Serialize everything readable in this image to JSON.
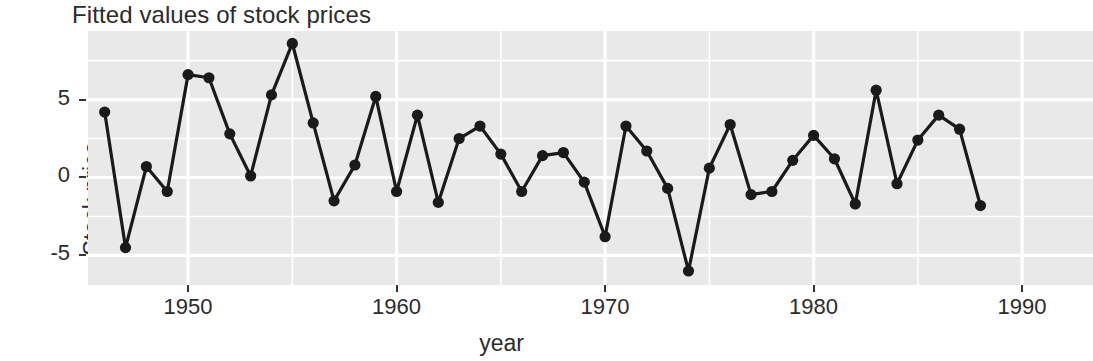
{
  "chart_data": {
    "type": "line",
    "title": "Fitted values of stock prices",
    "xlabel": "year",
    "ylabel": "Stock price",
    "grid": true,
    "legend": "none",
    "marker": "filled-circle",
    "xlim": [
      1945.2,
      1993.4
    ],
    "ylim": [
      -6.9,
      9.4
    ],
    "xticks": [
      1950,
      1960,
      1970,
      1980,
      1990
    ],
    "xticklabels": [
      "1950",
      "1960",
      "1970",
      "1980",
      "1990"
    ],
    "yticks": [
      -5,
      0,
      5
    ],
    "yticklabels": [
      "-5",
      "0",
      "5"
    ],
    "x": [
      1946,
      1947,
      1948,
      1949,
      1950,
      1951,
      1952,
      1953,
      1954,
      1955,
      1956,
      1957,
      1958,
      1959,
      1960,
      1961,
      1962,
      1963,
      1964,
      1965,
      1966,
      1967,
      1968,
      1969,
      1970,
      1971,
      1972,
      1973,
      1974,
      1975,
      1976,
      1977,
      1978,
      1979,
      1980,
      1981,
      1982,
      1983,
      1984,
      1985,
      1986,
      1987,
      1988
    ],
    "values": [
      4.2,
      -4.5,
      0.7,
      -0.9,
      6.6,
      6.4,
      2.8,
      0.1,
      5.3,
      8.6,
      3.5,
      -1.5,
      0.8,
      5.2,
      -0.9,
      4.0,
      -1.6,
      2.5,
      3.3,
      1.5,
      -0.9,
      1.4,
      1.6,
      -0.3,
      -3.8,
      3.3,
      1.7,
      -0.7,
      -6.0,
      0.6,
      3.4,
      -1.1,
      -0.9,
      1.1,
      2.7,
      1.2,
      -1.7,
      5.6,
      -0.4,
      2.4,
      4.0,
      3.1,
      -1.8
    ],
    "series_name": "Stock price",
    "line_color": "#1a1a1a",
    "point_color": "#1a1a1a",
    "panel_color": "#e9e9e9",
    "gridline_color": "#ffffff"
  }
}
